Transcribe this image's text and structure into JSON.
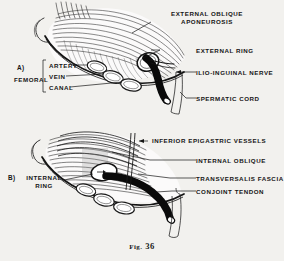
{
  "figure": {
    "caption_prefix": "Fig.",
    "caption_number": "36",
    "background_color": "#f2f1ee",
    "ink_color": "#161616"
  },
  "panels": [
    {
      "id": "A",
      "marker": "A)",
      "bracket_label": "FEMORAL",
      "bracket_items": [
        "ARTERY",
        "VEIN",
        "CANAL"
      ],
      "labels": [
        {
          "name": "external-oblique-aponeurosis",
          "line1": "EXTERNAL  OBLIQUE",
          "line2": "APONEUROSIS"
        },
        {
          "name": "external-ring",
          "line1": "EXTERNAL  RING",
          "line2": ""
        },
        {
          "name": "ilio-inguinal-nerve",
          "line1": "ILIO-INGUINAL  NERVE",
          "line2": ""
        },
        {
          "name": "spermatic-cord",
          "line1": "SPERMATIC  CORD",
          "line2": ""
        }
      ]
    },
    {
      "id": "B",
      "marker": "B)",
      "left_label_line1": "INTERNAL",
      "left_label_line2": "RING",
      "labels": [
        {
          "name": "inferior-epigastric-vessels",
          "line1": "INFERIOR  EPIGASTRIC  VESSELS",
          "line2": ""
        },
        {
          "name": "internal-oblique",
          "line1": "INTERNAL  OBLIQUE",
          "line2": ""
        },
        {
          "name": "transversalis-fascia",
          "line1": "TRANSVERSALIS  FASCIA",
          "line2": ""
        },
        {
          "name": "conjoint-tendon",
          "line1": "CONJOINT  TENDON",
          "line2": ""
        }
      ]
    }
  ]
}
